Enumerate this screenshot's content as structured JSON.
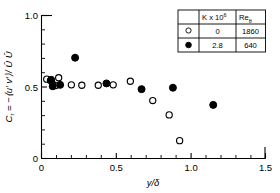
{
  "chart_data": {
    "type": "scatter",
    "title": "",
    "xlabel": "y/δ",
    "ylabel": "Cτ = −⟨u′v′⟩/Û²",
    "ylabel_parts": {
      "symbol": "C",
      "symbol_sub": "τ",
      "equals": " = −⟨u′ v′⟩/ ",
      "tail": "Û Û"
    },
    "xlim": [
      0,
      1.5
    ],
    "ylim": [
      0,
      1.0
    ],
    "xticks": [
      0,
      0.5,
      1.0,
      1.5
    ],
    "xtick_labels": [
      "0",
      "0.5",
      "1.0",
      "1.5"
    ],
    "yticks": [
      0,
      0.5,
      1.0
    ],
    "ytick_labels": [
      "0",
      "0.5",
      "1.0"
    ],
    "x_minor_count": 4,
    "y_minor_count": 4,
    "grid": false,
    "legend_position": "top-right inset table",
    "series": [
      {
        "name": "K x 10^6 = 0, Re_theta = 1860",
        "marker": "open-circle",
        "color": "#000000",
        "points": [
          {
            "x": 0.035,
            "y": 0.555
          },
          {
            "x": 0.06,
            "y": 0.545
          },
          {
            "x": 0.075,
            "y": 0.52
          },
          {
            "x": 0.095,
            "y": 0.51
          },
          {
            "x": 0.115,
            "y": 0.565
          },
          {
            "x": 0.2,
            "y": 0.515
          },
          {
            "x": 0.27,
            "y": 0.512
          },
          {
            "x": 0.38,
            "y": 0.512
          },
          {
            "x": 0.48,
            "y": 0.515
          },
          {
            "x": 0.595,
            "y": 0.54
          },
          {
            "x": 0.745,
            "y": 0.405
          },
          {
            "x": 0.855,
            "y": 0.305
          },
          {
            "x": 0.925,
            "y": 0.125
          }
        ]
      },
      {
        "name": "K x 10^6 = 2.8, Re_theta = 640",
        "marker": "filled-circle",
        "color": "#000000",
        "points": [
          {
            "x": 0.065,
            "y": 0.55
          },
          {
            "x": 0.075,
            "y": 0.505
          },
          {
            "x": 0.125,
            "y": 0.515
          },
          {
            "x": 0.225,
            "y": 0.705
          },
          {
            "x": 0.435,
            "y": 0.525
          },
          {
            "x": 0.67,
            "y": 0.485
          },
          {
            "x": 0.88,
            "y": 0.495
          },
          {
            "x": 1.15,
            "y": 0.375
          }
        ]
      }
    ],
    "legend_table": {
      "headers": [
        "",
        "K x 10",
        "Re"
      ],
      "header_exponent": "6",
      "header_subscript": "θ",
      "rows": [
        {
          "marker": "open-circle",
          "K": "0",
          "Re": "1860"
        },
        {
          "marker": "filled-circle",
          "K": "2.8",
          "Re": "640"
        }
      ]
    }
  }
}
